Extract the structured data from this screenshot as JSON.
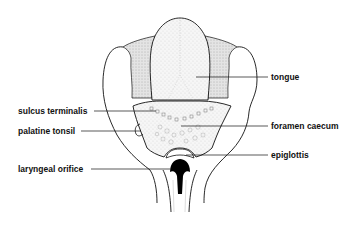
{
  "diagram": {
    "labels": {
      "tongue": "tongue",
      "sulcus_terminalis": "sulcus terminalis",
      "palatine_tonsil": "palatine tonsil",
      "foramen_caecum": "foramen caecum",
      "epiglottis": "epiglottis",
      "laryngeal_orifice": "laryngeal orifice"
    }
  }
}
